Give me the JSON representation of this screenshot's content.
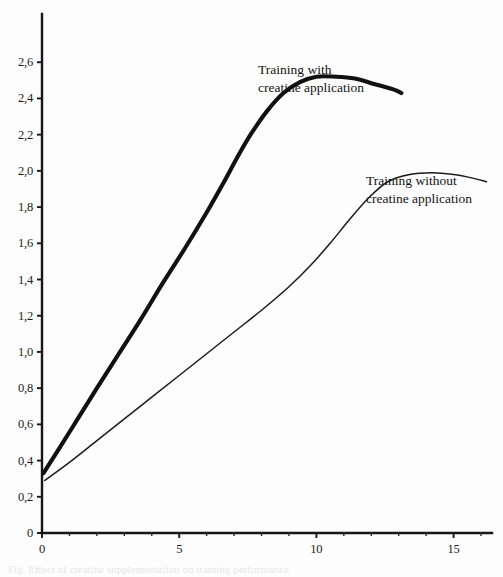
{
  "chart_data": {
    "type": "line",
    "title": "",
    "subtitle": "",
    "xlabel": "",
    "ylabel": "",
    "xlim": [
      0,
      16.4
    ],
    "ylim": [
      0,
      2.72
    ],
    "grid": false,
    "legend_position": "inline-annotation",
    "x_ticks_major": [
      0,
      5,
      10,
      15
    ],
    "x_tick_labels": [
      "0",
      "5",
      "10",
      "15"
    ],
    "x_ticks_minor": [
      1,
      2,
      3,
      4,
      6,
      7,
      8,
      9,
      11,
      12,
      13,
      14,
      16
    ],
    "y_ticks_major": [
      0,
      0.2,
      0.4,
      0.6,
      0.8,
      1.0,
      1.2,
      1.4,
      1.6,
      1.8,
      2.0,
      2.2,
      2.4,
      2.6
    ],
    "y_tick_labels": [
      "0",
      "0,2",
      "0,4",
      "0,6",
      "0,8",
      "1,0",
      "1,2",
      "1,4",
      "1,6",
      "1,8",
      "2,0",
      "2,2",
      "2,4",
      "2,6"
    ],
    "series": [
      {
        "name": "Training with creatine application",
        "style": "thick",
        "color": "#111111",
        "x": [
          0.05,
          0.6,
          1.3,
          2.0,
          2.8,
          3.6,
          4.4,
          5.2,
          6.0,
          6.6,
          7.1,
          7.6,
          8.2,
          8.8,
          9.4,
          10.0,
          10.7,
          11.4,
          12.1,
          12.8,
          13.1
        ],
        "y": [
          0.33,
          0.46,
          0.63,
          0.8,
          0.99,
          1.18,
          1.38,
          1.57,
          1.77,
          1.93,
          2.07,
          2.2,
          2.33,
          2.43,
          2.49,
          2.52,
          2.52,
          2.51,
          2.48,
          2.45,
          2.43
        ]
      },
      {
        "name": "Training without creatine application",
        "style": "thin",
        "color": "#1b1b1b",
        "x": [
          0.1,
          1.0,
          2.0,
          3.0,
          4.0,
          5.0,
          6.0,
          7.0,
          8.0,
          9.0,
          9.8,
          10.5,
          11.2,
          11.9,
          12.6,
          13.4,
          14.2,
          15.0,
          15.7,
          16.2
        ],
        "y": [
          0.29,
          0.39,
          0.51,
          0.63,
          0.75,
          0.87,
          0.99,
          1.11,
          1.23,
          1.36,
          1.48,
          1.6,
          1.73,
          1.85,
          1.94,
          1.98,
          1.99,
          1.98,
          1.96,
          1.94
        ]
      }
    ],
    "annotations": [
      {
        "id": "label-with-creatine",
        "line1": "Training with",
        "line2": "creatine application",
        "x_px": 258,
        "y_px": 61
      },
      {
        "id": "label-without-creatine",
        "line1": "Training without",
        "line2": "creatine application",
        "x_px": 366,
        "y_px": 172
      }
    ]
  },
  "caption": {
    "clipped_text": "Fig. Effect of creatine supplementation on training performance"
  }
}
